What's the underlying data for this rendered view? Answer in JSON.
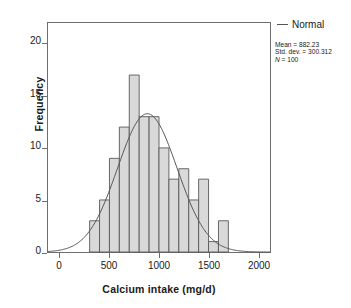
{
  "chart_data": {
    "type": "bar",
    "title": "",
    "subtitle": "",
    "xlabel": "Calcium intake (mg/d)",
    "ylabel": "Frequency",
    "xlim": [
      -120,
      2120
    ],
    "ylim": [
      0,
      22
    ],
    "grid": false,
    "bin_width": 100,
    "bin_starts": [
      300,
      400,
      500,
      600,
      700,
      800,
      900,
      1000,
      1100,
      1200,
      1300,
      1400,
      1500,
      1600
    ],
    "categories": [
      "300-400",
      "400-500",
      "500-600",
      "600-700",
      "700-800",
      "800-900",
      "900-1000",
      "1000-1100",
      "1100-1200",
      "1200-1300",
      "1300-1400",
      "1400-1500",
      "1500-1600",
      "1600-1700"
    ],
    "values": [
      3,
      5,
      9,
      12,
      17,
      13,
      13,
      10,
      7,
      8,
      5,
      7,
      1,
      3
    ],
    "xticks": [
      0,
      500,
      1000,
      1500,
      2000
    ],
    "xtick_labels": [
      "0",
      "500",
      "1000",
      "1500",
      "2000"
    ],
    "yticks": [
      0,
      5,
      10,
      15,
      20
    ],
    "ytick_labels": [
      "0",
      "5",
      "10",
      "15",
      "20"
    ],
    "series": [
      {
        "name": "Normal",
        "type": "line",
        "mean": 882.23,
        "std_dev": 300.312,
        "n": 100,
        "peak_frequency": 13.3
      }
    ],
    "legend_position": "upper right",
    "colors": {
      "bar_fill": "#d9d9d9",
      "bar_edge": "#595959",
      "curve": "#555555",
      "axis": "#6e6e6e",
      "text": "#1a1a1a"
    }
  },
  "axes": {
    "y_title": "Frequency",
    "x_title": "Calcium intake (mg/d)"
  },
  "legend": {
    "normal_label": "Normal"
  },
  "stats": {
    "mean_line": "Mean = 882.23",
    "std_dev_line": "Std. dev. = 300.312",
    "n_symbol": "N",
    "n_line": " = 100"
  }
}
